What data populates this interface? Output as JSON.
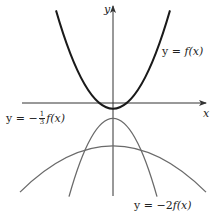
{
  "figure": {
    "axes": {
      "x_label": "x",
      "y_label": "y",
      "axis_color": "#333333"
    },
    "curves": [
      {
        "id": "f",
        "label_prefix": "y = ",
        "label_func": "f(x)",
        "color": "#1a1a1a",
        "stroke_width": 2.0
      },
      {
        "id": "neg2f",
        "label_prefix": "y = ",
        "label_coef": "−2",
        "label_func": "f(x)",
        "color": "#666666",
        "stroke_width": 1.3
      },
      {
        "id": "neg_third_f",
        "label_prefix": "y = −",
        "label_frac_num": "1",
        "label_frac_den": "3",
        "label_func": "f(x)",
        "color": "#666666",
        "stroke_width": 1.3
      }
    ]
  }
}
